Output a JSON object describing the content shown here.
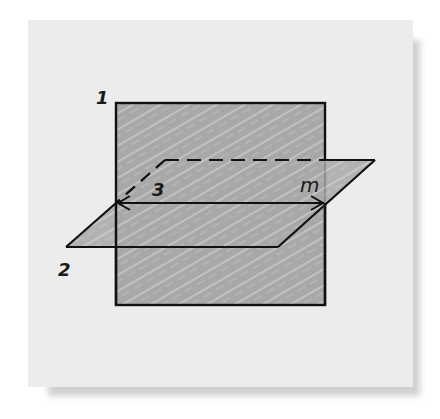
{
  "diagram": {
    "labels": {
      "plane_1": "1",
      "plane_2": "2",
      "line_3": "3",
      "line_m": "m"
    },
    "colors": {
      "card_background": "#ececec",
      "plane_fill": "#a9a9a9",
      "stroke": "#111111"
    }
  }
}
